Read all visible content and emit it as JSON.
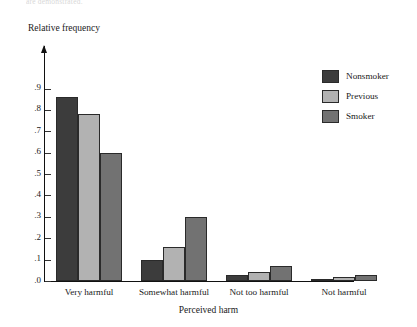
{
  "figure": {
    "top_caption": "are demonstrated."
  },
  "chart_data": {
    "type": "bar",
    "title": "",
    "xlabel": "Perceived harm",
    "ylabel": "Relative frequency",
    "categories": [
      "Very harmful",
      "Somewhat harmful",
      "Not too harmful",
      "Not harmful"
    ],
    "series": [
      {
        "name": "Nonsmoker",
        "color": "#3c3c3c",
        "values": [
          0.86,
          0.1,
          0.03,
          0.01
        ]
      },
      {
        "name": "Previous",
        "color": "#b2b2b2",
        "values": [
          0.78,
          0.16,
          0.04,
          0.02
        ]
      },
      {
        "name": "Smoker",
        "color": "#727272",
        "values": [
          0.6,
          0.3,
          0.07,
          0.03
        ]
      }
    ],
    "ylim": [
      0,
      0.9
    ],
    "yticks": [
      0.0,
      0.1,
      0.2,
      0.3,
      0.4,
      0.5,
      0.6,
      0.7,
      0.8,
      0.9
    ],
    "ytick_labels": [
      ".0",
      ".1",
      ".2",
      ".3",
      ".4",
      ".5",
      ".6",
      ".7",
      ".8",
      ".9"
    ],
    "grid": false,
    "legend_position": "right",
    "axis_arrow": true
  }
}
